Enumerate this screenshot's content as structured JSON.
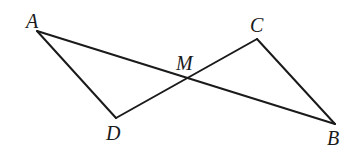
{
  "diagram": {
    "type": "geometry",
    "points": {
      "A": {
        "label": "A",
        "x": 37,
        "y": 31
      },
      "B": {
        "label": "B",
        "x": 335,
        "y": 124
      },
      "C": {
        "label": "C",
        "x": 257,
        "y": 39
      },
      "D": {
        "label": "D",
        "x": 116,
        "y": 118
      },
      "M": {
        "label": "M",
        "x": 185,
        "y": 80
      }
    },
    "segments": [
      {
        "from": "A",
        "to": "B"
      },
      {
        "from": "D",
        "to": "C"
      },
      {
        "from": "A",
        "to": "D"
      },
      {
        "from": "C",
        "to": "B"
      }
    ],
    "labels": {
      "A": "A",
      "B": "B",
      "C": "C",
      "D": "D",
      "M": "M"
    },
    "colors": {
      "stroke": "#1a1a1a",
      "background": "#ffffff"
    }
  }
}
